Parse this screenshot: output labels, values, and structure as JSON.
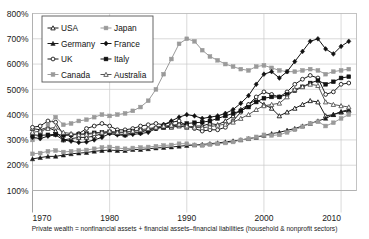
{
  "chart_data": {
    "type": "line",
    "title": "",
    "subtitle": "",
    "xlabel": "",
    "ylabel": "",
    "caption": "Private wealth = nonfinancial assets + financial assets–financial liabilities (household & nonprofit sectors)",
    "xlim": [
      1970,
      2012
    ],
    "ylim": [
      100,
      800
    ],
    "x_ticks": [
      "1970",
      "1980",
      "1990",
      "2000",
      "2010"
    ],
    "x_tick_values": [
      1970,
      1980,
      1990,
      2000,
      2010
    ],
    "y_ticks": [
      "100%",
      "200%",
      "300%",
      "400%",
      "500%",
      "600%",
      "700%",
      "800%"
    ],
    "y_tick_values": [
      100,
      200,
      300,
      400,
      500,
      600,
      700,
      800
    ],
    "grid": true,
    "legend_position": "top-left",
    "x": [
      1970,
      1971,
      1972,
      1973,
      1974,
      1975,
      1976,
      1977,
      1978,
      1979,
      1980,
      1981,
      1982,
      1983,
      1984,
      1985,
      1986,
      1987,
      1988,
      1989,
      1990,
      1991,
      1992,
      1993,
      1994,
      1995,
      1996,
      1997,
      1998,
      1999,
      2000,
      2001,
      2002,
      2003,
      2004,
      2005,
      2006,
      2007,
      2008,
      2009,
      2010,
      2011
    ],
    "series": [
      {
        "name": "USA",
        "marker": "open-triangle",
        "color": "#1a1a1a",
        "values": [
          345,
          340,
          350,
          335,
          300,
          305,
          310,
          310,
          315,
          325,
          330,
          325,
          320,
          330,
          330,
          340,
          350,
          350,
          350,
          355,
          350,
          355,
          355,
          365,
          360,
          375,
          395,
          420,
          440,
          460,
          440,
          425,
          395,
          410,
          425,
          440,
          455,
          450,
          395,
          400,
          410,
          415
        ]
      },
      {
        "name": "Germany",
        "marker": "filled-triangle",
        "color": "#1a1a1a",
        "values": [
          225,
          230,
          235,
          235,
          240,
          245,
          248,
          250,
          255,
          258,
          260,
          258,
          258,
          262,
          262,
          265,
          268,
          270,
          272,
          275,
          278,
          280,
          282,
          285,
          288,
          292,
          296,
          300,
          305,
          310,
          318,
          325,
          330,
          338,
          345,
          355,
          365,
          375,
          385,
          400,
          412,
          420
        ]
      },
      {
        "name": "UK",
        "marker": "open-circle",
        "color": "#1a1a1a",
        "values": [
          350,
          355,
          375,
          370,
          320,
          320,
          325,
          345,
          355,
          365,
          355,
          340,
          340,
          345,
          355,
          360,
          365,
          360,
          370,
          375,
          355,
          345,
          335,
          340,
          340,
          350,
          375,
          410,
          440,
          470,
          490,
          480,
          470,
          490,
          520,
          540,
          555,
          545,
          480,
          490,
          520,
          525
        ]
      },
      {
        "name": "Canada",
        "marker": "filled-square-gray",
        "color": "#9a9a9a",
        "values": [
          245,
          248,
          255,
          258,
          252,
          255,
          258,
          260,
          265,
          270,
          272,
          268,
          265,
          268,
          270,
          272,
          275,
          278,
          280,
          285,
          285,
          280,
          278,
          282,
          285,
          288,
          292,
          300,
          305,
          312,
          320,
          318,
          320,
          330,
          340,
          352,
          365,
          372,
          355,
          368,
          385,
          400
        ]
      },
      {
        "name": "Japan",
        "marker": "filled-square-gray",
        "color": "#9a9a9a",
        "values": [
          300,
          320,
          360,
          390,
          360,
          365,
          375,
          380,
          390,
          400,
          395,
          400,
          405,
          415,
          430,
          455,
          500,
          560,
          620,
          680,
          700,
          690,
          655,
          630,
          615,
          600,
          590,
          580,
          575,
          590,
          595,
          585,
          575,
          570,
          570,
          575,
          580,
          575,
          560,
          570,
          575,
          580
        ]
      },
      {
        "name": "France",
        "marker": "filled-diamond",
        "color": "#111111",
        "values": [
          310,
          305,
          315,
          320,
          300,
          295,
          290,
          292,
          300,
          310,
          325,
          320,
          318,
          322,
          325,
          330,
          345,
          360,
          375,
          390,
          400,
          395,
          385,
          390,
          395,
          405,
          420,
          445,
          475,
          520,
          560,
          570,
          545,
          570,
          610,
          650,
          690,
          700,
          660,
          640,
          670,
          690
        ]
      },
      {
        "name": "Italy",
        "marker": "filled-square-black",
        "color": "#111111",
        "values": [
          320,
          318,
          320,
          322,
          318,
          320,
          322,
          325,
          328,
          330,
          332,
          330,
          330,
          335,
          338,
          340,
          345,
          350,
          355,
          360,
          365,
          368,
          370,
          375,
          385,
          395,
          405,
          415,
          430,
          450,
          465,
          470,
          470,
          480,
          495,
          510,
          525,
          535,
          520,
          530,
          545,
          550
        ]
      },
      {
        "name": "Australia",
        "marker": "open-triangle",
        "color": "#555555",
        "values": [
          330,
          335,
          345,
          350,
          330,
          325,
          320,
          322,
          325,
          330,
          335,
          330,
          330,
          335,
          340,
          345,
          350,
          355,
          358,
          362,
          355,
          350,
          348,
          352,
          358,
          362,
          370,
          385,
          400,
          420,
          435,
          440,
          445,
          470,
          500,
          510,
          520,
          515,
          450,
          440,
          435,
          430
        ]
      }
    ]
  },
  "legend": {
    "entries": [
      {
        "label": "USA",
        "marker": "open-triangle",
        "color": "#1a1a1a"
      },
      {
        "label": "Japan",
        "marker": "filled-square-gray",
        "color": "#9a9a9a"
      },
      {
        "label": "Germany",
        "marker": "filled-triangle",
        "color": "#1a1a1a"
      },
      {
        "label": "France",
        "marker": "filled-diamond",
        "color": "#111111"
      },
      {
        "label": "UK",
        "marker": "open-circle",
        "color": "#1a1a1a"
      },
      {
        "label": "Italy",
        "marker": "filled-square-black",
        "color": "#111111"
      },
      {
        "label": "Canada",
        "marker": "filled-square-gray",
        "color": "#9a9a9a"
      },
      {
        "label": "Australia",
        "marker": "open-triangle",
        "color": "#555555"
      }
    ]
  },
  "colors": {
    "grid": "#c9c9c9",
    "axis": "#8a8a8a",
    "text": "#1a1a1a",
    "background": "#ffffff",
    "gray_series": "#9a9a9a"
  }
}
